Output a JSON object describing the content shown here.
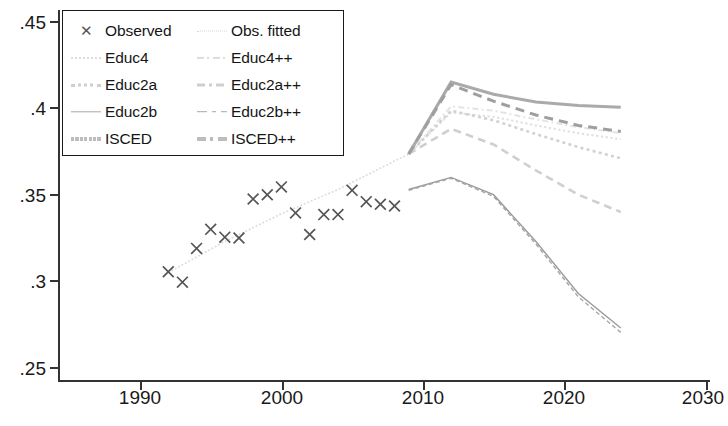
{
  "chart_data": {
    "type": "line",
    "title": "",
    "xlabel": "",
    "ylabel": "",
    "xlim": [
      1985,
      2030
    ],
    "ylim": [
      0.25,
      0.45
    ],
    "grid": false,
    "legend_position": "top-left",
    "xticks": [
      1990,
      2000,
      2010,
      2020,
      2030
    ],
    "yticks": [
      ".25",
      ".3",
      ".35",
      ".4",
      ".45"
    ],
    "ytick_values": [
      0.25,
      0.3,
      0.35,
      0.4,
      0.45
    ],
    "observed": {
      "name": "Observed",
      "marker": "x",
      "x": [
        1992,
        1993,
        1994,
        1995,
        1996,
        1997,
        1998,
        1999,
        2000,
        2001,
        2002,
        2003,
        2004,
        2005,
        2006,
        2007,
        2008
      ],
      "y": [
        0.3055,
        0.2995,
        0.319,
        0.33,
        0.3255,
        0.325,
        0.3475,
        0.35,
        0.3545,
        0.3395,
        0.327,
        0.3385,
        0.3385,
        0.3525,
        0.346,
        0.3445,
        0.3435
      ]
    },
    "series": [
      {
        "name": "Obs. fitted",
        "style": "dotted",
        "width": 1.6,
        "color": "#d9d9d9",
        "x": [
          1992,
          1996,
          2000,
          2004,
          2009
        ],
        "y": [
          0.305,
          0.323,
          0.339,
          0.353,
          0.3735
        ]
      },
      {
        "name": "Educ4",
        "style": "dotted",
        "width": 2.0,
        "color": "#e0e0e0",
        "x": [
          2009,
          2012,
          2015,
          2018,
          2021,
          2024
        ],
        "y": [
          0.3735,
          0.3975,
          0.395,
          0.39,
          0.3855,
          0.382
        ]
      },
      {
        "name": "Educ4++",
        "style": "dashdot",
        "width": 2.0,
        "color": "#e3e3e3",
        "x": [
          2009,
          2012,
          2015,
          2018,
          2021,
          2024
        ],
        "y": [
          0.3735,
          0.401,
          0.3985,
          0.3935,
          0.389,
          0.3855
        ]
      },
      {
        "name": "Educ2a",
        "style": "dotted",
        "width": 2.6,
        "color": "#d2d2d2",
        "x": [
          2009,
          2012,
          2015,
          2018,
          2021,
          2024
        ],
        "y": [
          0.3735,
          0.3985,
          0.393,
          0.385,
          0.3775,
          0.371
        ]
      },
      {
        "name": "Educ2a++",
        "style": "dashed",
        "width": 2.6,
        "color": "#cfcfcf",
        "x": [
          2009,
          2012,
          2015,
          2018,
          2021,
          2024
        ],
        "y": [
          0.3735,
          0.388,
          0.379,
          0.364,
          0.35,
          0.34
        ]
      },
      {
        "name": "Educ2b",
        "style": "solid",
        "width": 1.4,
        "color": "#9a9a9a",
        "x": [
          2009,
          2012,
          2015,
          2018,
          2021,
          2024
        ],
        "y": [
          0.353,
          0.36,
          0.35,
          0.323,
          0.293,
          0.273
        ]
      },
      {
        "name": "Educ2b++",
        "style": "dashed",
        "width": 1.4,
        "color": "#a5a5a5",
        "x": [
          2009,
          2012,
          2015,
          2018,
          2021,
          2024
        ],
        "y": [
          0.3525,
          0.3595,
          0.349,
          0.3215,
          0.291,
          0.2705
        ]
      },
      {
        "name": "ISCED",
        "style": "solid",
        "width": 3.0,
        "color": "#aaaaaa",
        "x": [
          2009,
          2012,
          2015,
          2018,
          2021,
          2024
        ],
        "y": [
          0.3735,
          0.415,
          0.408,
          0.4035,
          0.4015,
          0.4005
        ]
      },
      {
        "name": "ISCED++",
        "style": "dashed",
        "width": 3.0,
        "color": "#9f9f9f",
        "x": [
          2009,
          2012,
          2015,
          2018,
          2021,
          2024
        ],
        "y": [
          0.3735,
          0.4135,
          0.404,
          0.396,
          0.39,
          0.3865
        ]
      }
    ]
  },
  "legend": {
    "rows": [
      {
        "left_marker": "x-marker",
        "left_label": "Observed",
        "right_marker": "dotted-line",
        "right_label": "Obs. fitted"
      },
      {
        "left_marker": "dotted-line",
        "left_label": "Educ4",
        "right_marker": "dashdot-line",
        "right_label": "Educ4++"
      },
      {
        "left_marker": "dotted-thick-line",
        "left_label": "Educ2a",
        "right_marker": "dashed-line",
        "right_label": "Educ2a++"
      },
      {
        "left_marker": "solid-thin-line",
        "left_label": "Educ2b",
        "right_marker": "dashed-thin-line",
        "right_label": "Educ2b++"
      },
      {
        "left_marker": "solid-thick-line",
        "left_label": "ISCED",
        "right_marker": "dashed-thick-line",
        "right_label": "ISCED++"
      }
    ]
  },
  "axis": {
    "x_labels": [
      "1990",
      "2000",
      "2010",
      "2020",
      "2030"
    ],
    "y_labels": [
      ".45",
      ".4",
      ".35",
      ".3",
      ".25"
    ]
  },
  "colors": {
    "axis": "#333333",
    "text": "#1a1a1a",
    "marker": "#555555"
  }
}
